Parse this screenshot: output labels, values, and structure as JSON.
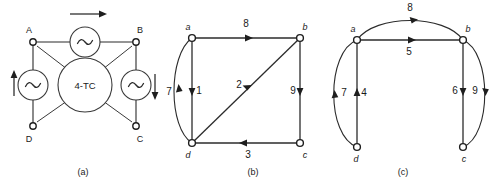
{
  "figure": {
    "captions": [
      "(a)",
      "(b)",
      "(c)"
    ],
    "panel_a": {
      "caption": "(a)",
      "center_label": "4-TC",
      "nodes": [
        {
          "id": "A",
          "label": "A",
          "x": 33,
          "y": 42
        },
        {
          "id": "B",
          "label": "B",
          "x": 136,
          "y": 42
        },
        {
          "id": "C",
          "label": "C",
          "x": 136,
          "y": 126
        },
        {
          "id": "D",
          "label": "D",
          "x": 33,
          "y": 126
        }
      ],
      "sources": [
        {
          "name": "ac-source-top",
          "x": 85,
          "y": 42
        },
        {
          "name": "ac-source-left",
          "x": 33,
          "y": 85
        },
        {
          "name": "ac-source-right",
          "x": 136,
          "y": 85
        }
      ],
      "flow_arrows": [
        {
          "name": "flow-arrow-top",
          "direction": "right"
        },
        {
          "name": "flow-arrow-left",
          "direction": "up"
        },
        {
          "name": "flow-arrow-right",
          "direction": "down"
        }
      ]
    },
    "panel_b": {
      "caption": "(b)",
      "nodes": [
        {
          "id": "a",
          "label": "a",
          "x": 192,
          "y": 38
        },
        {
          "id": "b",
          "label": "b",
          "x": 300,
          "y": 38
        },
        {
          "id": "c",
          "label": "c",
          "x": 300,
          "y": 143
        },
        {
          "id": "d",
          "label": "d",
          "x": 192,
          "y": 143
        }
      ],
      "edges": [
        {
          "label": "8",
          "from": "a",
          "to": "b",
          "shape": "straight",
          "direction": "right"
        },
        {
          "label": "7",
          "from": "d",
          "to": "a",
          "shape": "arc-left",
          "direction": "up"
        },
        {
          "label": "1",
          "from": "a",
          "to": "d",
          "shape": "straight",
          "direction": "down"
        },
        {
          "label": "2",
          "from": "d",
          "to": "b",
          "shape": "diagonal",
          "direction": "up-right"
        },
        {
          "label": "9",
          "from": "b",
          "to": "c",
          "shape": "straight",
          "direction": "down"
        },
        {
          "label": "3",
          "from": "c",
          "to": "d",
          "shape": "straight",
          "direction": "left"
        }
      ]
    },
    "panel_c": {
      "caption": "(c)",
      "nodes": [
        {
          "id": "a",
          "label": "a",
          "x": 357,
          "y": 40
        },
        {
          "id": "b",
          "label": "b",
          "x": 463,
          "y": 40
        },
        {
          "id": "c",
          "label": "c",
          "x": 463,
          "y": 147
        },
        {
          "id": "d",
          "label": "d",
          "x": 357,
          "y": 147
        }
      ],
      "edges": [
        {
          "label": "8",
          "from": "a",
          "to": "b",
          "shape": "arc-top",
          "direction": "right"
        },
        {
          "label": "5",
          "from": "a",
          "to": "b",
          "shape": "straight",
          "direction": "right"
        },
        {
          "label": "7",
          "from": "d",
          "to": "a",
          "shape": "arc-left",
          "direction": "up"
        },
        {
          "label": "4",
          "from": "d",
          "to": "a",
          "shape": "straight",
          "direction": "up"
        },
        {
          "label": "6",
          "from": "b",
          "to": "c",
          "shape": "straight",
          "direction": "down"
        },
        {
          "label": "9",
          "from": "b",
          "to": "c",
          "shape": "arc-right",
          "direction": "down"
        }
      ]
    }
  },
  "colors": {
    "ink": "#1e1e1e",
    "wire": "#2b2b2b",
    "background": "#ffffff"
  }
}
